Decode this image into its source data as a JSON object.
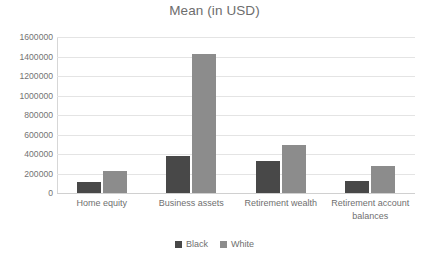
{
  "chart_data": {
    "type": "bar",
    "title": "Mean (in USD)",
    "xlabel": "",
    "ylabel": "",
    "ylim": [
      0,
      1600000
    ],
    "ytick_step": 200000,
    "yticks": [
      1600000,
      1400000,
      1200000,
      1000000,
      800000,
      600000,
      400000,
      200000,
      0
    ],
    "ytick_labels": [
      "1600000",
      "1400000",
      "1200000",
      "1000000",
      "800000",
      "600000",
      "400000",
      "200000",
      "0"
    ],
    "grid": true,
    "legend_position": "bottom",
    "categories": [
      "Home equity",
      "Business assets",
      "Retirement wealth",
      "Retirement account balances"
    ],
    "series": [
      {
        "name": "Black",
        "color": "#484848",
        "values": [
          110000,
          380000,
          325000,
          125000
        ]
      },
      {
        "name": "White",
        "color": "#8c8c8c",
        "values": [
          230000,
          1425000,
          490000,
          275000
        ]
      }
    ]
  },
  "colors": {
    "background": "#ffffff",
    "title_text": "#6d6d6d",
    "tick_text": "#737373",
    "gridline": "#e4e4e4",
    "axis_line": "#d0d0d0",
    "series_black": "#484848",
    "series_white": "#8c8c8c"
  }
}
